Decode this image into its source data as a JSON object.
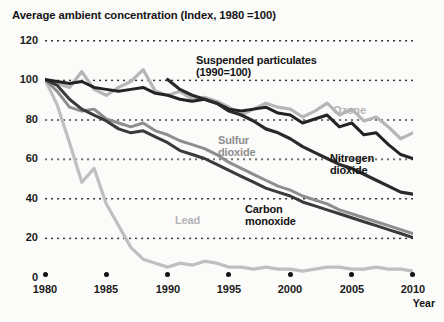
{
  "chart_data": {
    "type": "line",
    "title": "Average ambient concentration (Index, 1980 =100)",
    "xlabel": "Year",
    "ylabel": "",
    "xlim": [
      1980,
      2010
    ],
    "ylim": [
      0,
      120
    ],
    "grid": "dotted-horizontal",
    "legend": "inline-annotations",
    "y_ticks": [
      "0",
      "20",
      "40",
      "60",
      "80",
      "100",
      "120"
    ],
    "x_ticks": [
      "1980",
      "1985",
      "1990",
      "1995",
      "2000",
      "2005",
      "2010"
    ],
    "x": [
      1980,
      1981,
      1982,
      1983,
      1984,
      1985,
      1986,
      1987,
      1988,
      1989,
      1990,
      1991,
      1992,
      1993,
      1994,
      1995,
      1996,
      1997,
      1998,
      1999,
      2000,
      2001,
      2002,
      2003,
      2004,
      2005,
      2006,
      2007,
      2008,
      2009,
      2010
    ],
    "series": [
      {
        "name": "Suspended particulates",
        "note": "(1990=100)",
        "color": "#2a2a2a",
        "annotation": "Suspended particulates\n(1990=100)",
        "values": [
          null,
          null,
          null,
          null,
          null,
          null,
          null,
          null,
          null,
          null,
          100,
          95,
          92,
          90,
          88,
          84,
          82,
          79,
          75,
          73,
          70,
          66,
          63,
          60,
          57,
          55,
          52,
          49,
          46,
          43,
          42
        ]
      },
      {
        "name": "Ozone",
        "color": "#b6b6b6",
        "annotation": "Ozone",
        "values": [
          100,
          98,
          96,
          104,
          95,
          92,
          96,
          99,
          105,
          94,
          92,
          94,
          90,
          91,
          89,
          86,
          82,
          85,
          88,
          86,
          85,
          81,
          84,
          88,
          82,
          85,
          79,
          81,
          76,
          70,
          73
        ]
      },
      {
        "name": "Nitrogen dioxide",
        "color": "#232323",
        "annotation": "Nitrogen dioxide",
        "values": [
          100,
          99,
          98,
          99,
          96,
          95,
          94,
          95,
          96,
          93,
          92,
          90,
          89,
          90,
          88,
          85,
          84,
          85,
          86,
          83,
          82,
          78,
          80,
          82,
          76,
          78,
          72,
          73,
          67,
          62,
          60
        ]
      },
      {
        "name": "Sulfur dioxide",
        "color": "#8e8e8e",
        "annotation": "Sulfur dioxide",
        "values": [
          100,
          94,
          86,
          84,
          85,
          80,
          78,
          76,
          78,
          74,
          72,
          69,
          67,
          65,
          62,
          58,
          55,
          52,
          49,
          46,
          44,
          41,
          39,
          37,
          34,
          32,
          30,
          28,
          26,
          24,
          22
        ]
      },
      {
        "name": "Carbon monoxide",
        "color": "#3a3a3a",
        "annotation": "Carbon monoxide",
        "values": [
          100,
          97,
          90,
          85,
          82,
          79,
          75,
          73,
          74,
          71,
          68,
          64,
          62,
          60,
          57,
          54,
          51,
          48,
          45,
          43,
          41,
          38,
          36,
          34,
          32,
          30,
          28,
          26,
          24,
          22,
          20
        ]
      },
      {
        "name": "Lead",
        "color": "#bfbfbf",
        "annotation": "Lead",
        "values": [
          100,
          87,
          68,
          48,
          55,
          37,
          26,
          15,
          9,
          7,
          5,
          7,
          6,
          8,
          7,
          5,
          5,
          4,
          5,
          4,
          4,
          3,
          4,
          5,
          5,
          4,
          4,
          5,
          4,
          4,
          3
        ]
      }
    ]
  },
  "annotations": {
    "suspended_line1": "Suspended particulates",
    "suspended_line2": "(1990=100)",
    "ozone": "Ozone",
    "nitrogen_line1": "Nitrogen",
    "nitrogen_line2": "dioxide",
    "sulfur_line1": "Sulfur",
    "sulfur_line2": "dioxide",
    "carbon_line1": "Carbon",
    "carbon_line2": "monoxide",
    "lead": "Lead"
  },
  "axes": {
    "y": {
      "t120": "120",
      "t100": "100",
      "t80": "80",
      "t60": "60",
      "t40": "40",
      "t20": "20",
      "t0": "0"
    },
    "x": {
      "y1980": "1980",
      "y1985": "1985",
      "y1990": "1990",
      "y1995": "1995",
      "y2000": "2000",
      "y2005": "2005",
      "y2010": "2010"
    },
    "x_axis_name": "Year"
  }
}
